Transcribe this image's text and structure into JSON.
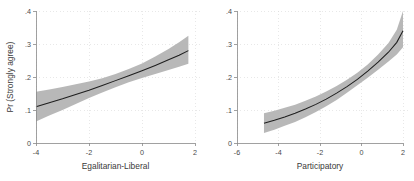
{
  "figure": {
    "background_color": "#ffffff",
    "band_color": "#b4b4b4",
    "line_color": "#1e1e1e",
    "axis_color": "#8a8a8a",
    "grid_color": "#d8d8d8"
  },
  "chart_data": [
    {
      "type": "line",
      "panel": "left",
      "title": "",
      "xlabel": "Egalitarian-Liberal",
      "ylabel": "Pr (Strongly agree)",
      "xlim": [
        -4,
        2
      ],
      "ylim": [
        0,
        0.4
      ],
      "grid": true,
      "legend": "none",
      "xticks": [
        -4,
        -2,
        0,
        2
      ],
      "xticklabels": [
        "-4",
        "-2",
        "0",
        "2"
      ],
      "yticks": [
        0,
        0.1,
        0.2,
        0.3,
        0.4
      ],
      "yticklabels": [
        "0",
        ".1",
        ".2",
        ".3",
        ".4"
      ],
      "x": [
        -4.0,
        -3.5,
        -3.0,
        -2.5,
        -2.0,
        -1.5,
        -1.0,
        -0.5,
        0.0,
        0.5,
        1.0,
        1.4,
        1.75
      ],
      "series": [
        {
          "name": "Pr (Strongly agree)",
          "values": [
            0.11,
            0.122,
            0.134,
            0.147,
            0.16,
            0.174,
            0.189,
            0.204,
            0.219,
            0.235,
            0.252,
            0.266,
            0.28
          ]
        },
        {
          "name": "95% CI lower",
          "values": [
            0.065,
            0.083,
            0.1,
            0.118,
            0.136,
            0.153,
            0.169,
            0.184,
            0.197,
            0.209,
            0.221,
            0.231,
            0.24
          ]
        },
        {
          "name": "95% CI upper",
          "values": [
            0.155,
            0.162,
            0.17,
            0.178,
            0.186,
            0.196,
            0.209,
            0.224,
            0.241,
            0.262,
            0.285,
            0.305,
            0.325
          ]
        }
      ]
    },
    {
      "type": "line",
      "panel": "right",
      "title": "",
      "xlabel": "Participatory",
      "ylabel": "",
      "xlim": [
        -6,
        2
      ],
      "ylim": [
        0,
        0.4
      ],
      "grid": true,
      "legend": "none",
      "xticks": [
        -6,
        -4,
        -2,
        0,
        2
      ],
      "xticklabels": [
        "-6",
        "-4",
        "-2",
        "0",
        "2"
      ],
      "yticks": [
        0,
        0.1,
        0.2,
        0.3,
        0.4
      ],
      "yticklabels": [
        "0",
        ".1",
        ".2",
        ".3",
        ".4"
      ],
      "x": [
        -4.7,
        -4.2,
        -3.7,
        -3.2,
        -2.7,
        -2.2,
        -1.7,
        -1.2,
        -0.7,
        -0.2,
        0.3,
        0.8,
        1.3,
        1.7,
        2.0
      ],
      "series": [
        {
          "name": "Pr (Strongly agree)",
          "values": [
            0.06,
            0.069,
            0.079,
            0.09,
            0.103,
            0.117,
            0.133,
            0.151,
            0.171,
            0.193,
            0.218,
            0.245,
            0.275,
            0.305,
            0.34
          ]
        },
        {
          "name": "95% CI lower",
          "values": [
            0.03,
            0.04,
            0.052,
            0.064,
            0.078,
            0.094,
            0.111,
            0.13,
            0.152,
            0.175,
            0.198,
            0.222,
            0.247,
            0.268,
            0.29
          ]
        },
        {
          "name": "95% CI upper",
          "values": [
            0.09,
            0.098,
            0.107,
            0.116,
            0.128,
            0.141,
            0.156,
            0.173,
            0.192,
            0.213,
            0.238,
            0.268,
            0.303,
            0.343,
            0.4
          ]
        }
      ]
    }
  ]
}
